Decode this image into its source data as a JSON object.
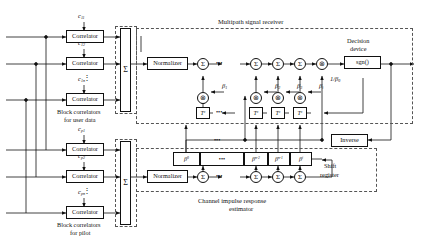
{
  "figure": {
    "type": "block-diagram"
  },
  "groups": {
    "multipath_receiver": "Multipath signal receiver",
    "channel_estimator_line1": "Channel impulse response",
    "channel_estimator_line2": "estimator",
    "user_correlators_line1": "Block correlators",
    "user_correlators_line2": "for user data",
    "pilot_correlators_line1": "Block correlators",
    "pilot_correlators_line2": "for pilot"
  },
  "blocks": {
    "correlator": "Correlator",
    "normalizer": "Normalizer",
    "inverse": "Inverse",
    "decision_line1": "Decision",
    "decision_line2": "device",
    "decision_function": "sgn()",
    "shift_line1": "Shift",
    "shift_line2": "register"
  },
  "symbols": {
    "sum": "Σ",
    "multiply": "⊗",
    "ellipsis": "•••",
    "vertical_ellipsis": "⋮"
  },
  "user_correlator_inputs": [
    "c11",
    "c12",
    "c1n"
  ],
  "pilot_correlator_inputs": [
    "cp1",
    "cp2",
    "cpn"
  ],
  "receiver_taps": {
    "beta_labels": [
      "β1",
      "β2",
      "β3",
      "βi"
    ],
    "delay_label": "Tc",
    "gain_label": "1/β0"
  },
  "shift_register_cells": [
    "β0",
    "•••",
    "βn-2",
    "βn-1",
    "βi"
  ],
  "colors": {
    "line": "#111111",
    "dashed_boundary": "#555555",
    "background": "#ffffff"
  }
}
